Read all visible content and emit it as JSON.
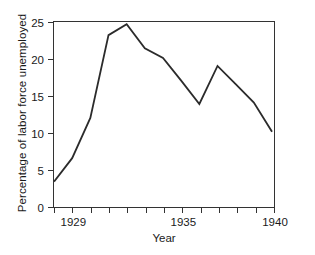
{
  "chart_data": {
    "type": "line",
    "title": "",
    "xlabel": "Year",
    "ylabel": "Percentage of labor force unemployed",
    "xlim": [
      1928,
      1940
    ],
    "ylim": [
      0,
      25
    ],
    "grid": false,
    "legend": null,
    "x_tick_values": [
      1928,
      1929,
      1930,
      1931,
      1932,
      1933,
      1934,
      1935,
      1936,
      1937,
      1938,
      1939,
      1940
    ],
    "x_tick_labels": [
      "",
      "1929",
      "",
      "",
      "",
      "",
      "",
      "1935",
      "",
      "",
      "",
      "",
      "1940"
    ],
    "y_tick_values": [
      0,
      5,
      10,
      15,
      20,
      25
    ],
    "y_tick_labels": [
      "0",
      "5",
      "10",
      "15",
      "20",
      "25"
    ],
    "series": [
      {
        "name": "Unemployment rate",
        "color": "#2b2b2b",
        "x": [
          1928,
          1929,
          1930,
          1931,
          1932,
          1933,
          1934,
          1935,
          1936,
          1937,
          1938,
          1939,
          1940
        ],
        "values": [
          3.2,
          6.4,
          11.9,
          23.2,
          24.7,
          21.4,
          20.1,
          17.0,
          13.8,
          19.0,
          16.5,
          14.0,
          10.0
        ]
      }
    ]
  }
}
